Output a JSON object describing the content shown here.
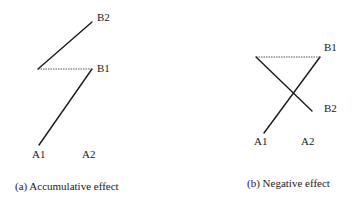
{
  "panels": [
    {
      "id": "a",
      "caption": "(a) Accumulative effect",
      "labels": {
        "B2": "B2",
        "B1": "B1",
        "A1": "A1",
        "A2": "A2"
      },
      "segments": [
        {
          "from": "A1",
          "to": "B1",
          "style": "solid"
        },
        {
          "from": "B1",
          "to": "vertex",
          "style": "dotted"
        },
        {
          "from": "vertex",
          "to": "B2",
          "style": "solid"
        }
      ]
    },
    {
      "id": "b",
      "caption": "(b) Negative effect",
      "labels": {
        "B1": "B1",
        "B2": "B2",
        "A1": "A1",
        "A2": "A2"
      },
      "segments": [
        {
          "from": "A1",
          "to": "B1",
          "style": "solid"
        },
        {
          "from": "B1",
          "to": "vertex",
          "style": "dotted"
        },
        {
          "from": "vertex",
          "to": "B2",
          "style": "solid"
        }
      ]
    }
  ],
  "colors": {
    "line": "#1a1a1a",
    "dotted_line": "#555555",
    "background": "#ffffff"
  }
}
